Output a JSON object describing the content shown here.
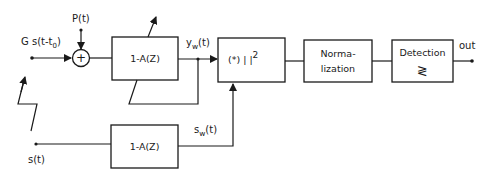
{
  "diagram": {
    "type": "block-diagram",
    "inputs": {
      "received_signal": {
        "label": "G s(t-t",
        "subscript": "0",
        "close": ")"
      },
      "noise": {
        "label": "P(t)"
      },
      "reference_signal": {
        "label": "s(t)"
      }
    },
    "summing_junction": {
      "symbol": "+"
    },
    "blocks": {
      "whitening_filter_top": {
        "label": "1-A(Z)"
      },
      "correlator": {
        "label": "(*)  | |",
        "superscript": "2"
      },
      "normalization": {
        "line1": "Norma-",
        "line2": "lization"
      },
      "detection": {
        "line1": "Detection",
        "symbol": "≷"
      },
      "whitening_filter_bottom": {
        "label": "1-A(Z)"
      }
    },
    "signals": {
      "yw": {
        "base": "y",
        "sub": "w",
        "tail": "(t)"
      },
      "sw": {
        "base": "s",
        "sub": "w",
        "tail": "(t)"
      }
    },
    "output": {
      "label": "out"
    },
    "colors": {
      "stroke": "#1a1a1a",
      "background": "#ffffff"
    }
  }
}
